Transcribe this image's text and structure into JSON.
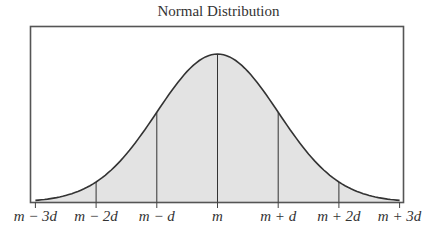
{
  "chart_data": {
    "type": "area",
    "title": "Normal Distribution",
    "xlabel": "",
    "ylabel": "",
    "distribution": "normal",
    "mean_label": "m",
    "sd_label": "d",
    "x_range_sd": [
      -3,
      3
    ],
    "tick_labels": [
      "m − 3d",
      "m − 2d",
      "m − d",
      "m",
      "m + d",
      "m + 2d",
      "m + 3d"
    ],
    "tick_positions_sd": [
      -3,
      -2,
      -1,
      0,
      1,
      2,
      3
    ],
    "vertical_lines_sd": [
      -2,
      -1,
      0,
      1,
      2
    ],
    "grid": false,
    "legend": "none",
    "fill_color": "#e3e3e3",
    "line_color": "#333333"
  }
}
